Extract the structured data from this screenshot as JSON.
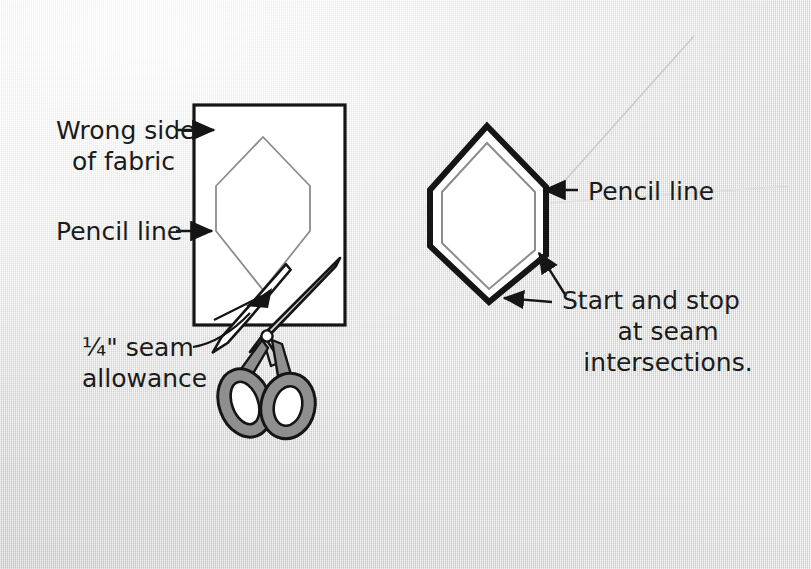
{
  "illustration": {
    "title": "Hexagon patch cutting diagram",
    "background_color": "#e9e9e9",
    "ink_color": "#1b1b1b",
    "pencil_line_color": "#8c8c8c",
    "handle_color": "#8f8f8f",
    "blade_color": "#ffffff"
  },
  "labels": {
    "wrong_side_line1": "Wrong side",
    "wrong_side_line2": "of fabric",
    "pencil_line_left": "Pencil line",
    "seam_allowance_line1": "¼\" seam",
    "seam_allowance_line2": "allowance",
    "pencil_line_right": "Pencil line",
    "start_stop_line1": "Start and stop",
    "start_stop_line2": "at seam",
    "start_stop_line3": "intersections."
  },
  "figures": {
    "left": {
      "name": "fabric-square-with-marked-hexagon",
      "fabric_rect": {
        "x": 194,
        "y": 105,
        "width": 151,
        "height": 220
      },
      "hexagon_points": "263,137 216,186 216,231 263,290 310,231 310,186"
    },
    "right": {
      "name": "cut-hexagon-patch",
      "outer_points": "487,126 430,190 430,246 489,302 546,255 546,187",
      "inner_points": "487,143 442,192 442,243 489,289 535,250 535,192"
    },
    "scissors": {
      "name": "scissors",
      "pivot": {
        "x": 267,
        "y": 335
      },
      "blade_tip_upper": {
        "x": 340,
        "y": 258
      },
      "blade_tip_lower": {
        "x": 318,
        "y": 264
      }
    }
  },
  "annotations": [
    {
      "name": "arrow-wrong-side",
      "from": [
        178,
        130
      ],
      "to": [
        215,
        130
      ],
      "type": "straight-arrow"
    },
    {
      "name": "arrow-pencil-line-left",
      "from": [
        178,
        231
      ],
      "to": [
        213,
        231
      ],
      "type": "straight-arrow"
    },
    {
      "name": "leader-seam-allowance",
      "type": "curved-leader"
    },
    {
      "name": "arrow-pencil-line-right",
      "from": [
        575,
        190
      ],
      "to": [
        543,
        190
      ],
      "type": "straight-arrow"
    },
    {
      "name": "leader-start-stop-upper",
      "from": [
        556,
        290
      ],
      "to": [
        538,
        252
      ],
      "type": "straight-arrow"
    },
    {
      "name": "leader-start-stop-lower",
      "from": [
        548,
        300
      ],
      "to": [
        502,
        298
      ],
      "type": "straight-arrow"
    }
  ]
}
